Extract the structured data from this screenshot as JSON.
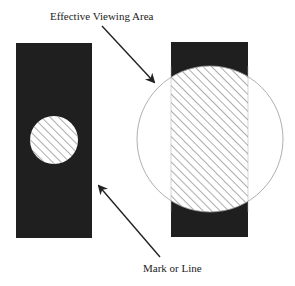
{
  "labels": {
    "top": "Effective Viewing Area",
    "bottom": "Mark or Line"
  },
  "colors": {
    "rect_fill": "#1f1f1f",
    "hatch": "#8a8a8a",
    "circle_stroke": "#9a9a9a",
    "arrow": "#222222",
    "background": "#ffffff"
  },
  "figure": {
    "left_panel": {
      "shape": "dark rectangle with small hatched circle"
    },
    "right_panel": {
      "shape": "dark rectangle overlapped by large circle; intersection hatched"
    }
  }
}
